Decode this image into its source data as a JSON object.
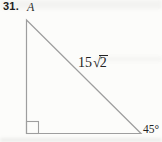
{
  "problem": {
    "number": "31.",
    "vertex_label": "A",
    "hypotenuse_prefix": "15",
    "hypotenuse_radical": "√",
    "hypotenuse_radicand": "2",
    "angle_label": "45°"
  },
  "figure": {
    "type": "right-triangle",
    "right_angle_position": "bottom-left",
    "acute_angle_position": "bottom-right"
  },
  "colors": {
    "line": "#9e9e9e",
    "text": "#232323",
    "background": "#fcfcfa"
  }
}
